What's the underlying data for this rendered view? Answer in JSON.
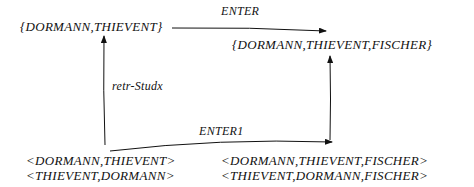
{
  "diagram": {
    "top_left_set": "{DORMANN,THIEVENT}",
    "top_right_set": "{DORMANN,THIEVENT,FISCHER}",
    "top_arrow_label": "ENTER",
    "left_arrow_label": "retr-Studx",
    "bottom_arrow_label": "ENTER1",
    "bottom_left_tuples": [
      "<DORMANN,THIEVENT>",
      "<THIEVENT,DORMANN>"
    ],
    "bottom_right_tuples": [
      "<DORMANN,THIEVENT,FISCHER>",
      "<THIEVENT,DORMANN,FISCHER>"
    ]
  }
}
